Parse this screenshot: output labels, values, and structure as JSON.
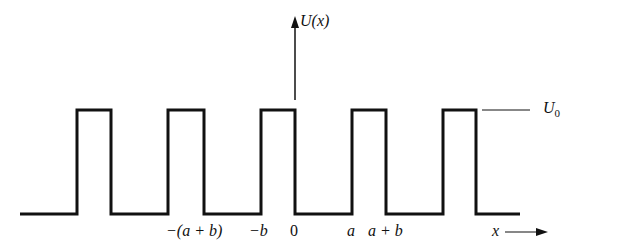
{
  "diagram": {
    "y_axis_label": "U(x)",
    "x_axis_label": "x",
    "barrier_height_label": "U",
    "barrier_height_subscript": "0",
    "tick_labels": [
      "−(a + b)",
      "−b",
      "0",
      "a",
      "a + b"
    ],
    "colors": {
      "line": "#111111",
      "background": "#ffffff"
    }
  }
}
